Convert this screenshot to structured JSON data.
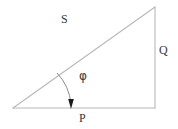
{
  "figure": {
    "background_color": "#ffffff",
    "line_color": "#b8b8b8",
    "arc_color": "#8c8c8c",
    "arrow_color": "#1a1a1a",
    "text_color": "#3a3a3a"
  },
  "labels": {
    "hypotenuse": "S",
    "vertical_side": "Q",
    "horizontal_side": "P",
    "angle": "φ"
  },
  "geometry": {
    "apex_left": {
      "x": 13,
      "y": 108
    },
    "corner_bottom_right": {
      "x": 155,
      "y": 108
    },
    "corner_top_right": {
      "x": 155,
      "y": 7
    },
    "arc_start": {
      "x": 57,
      "y": 73
    },
    "arc_end": {
      "x": 71,
      "y": 105
    },
    "arrow_tip": {
      "x": 71,
      "y": 108
    }
  }
}
